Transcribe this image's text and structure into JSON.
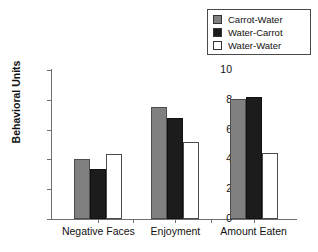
{
  "chart_data": {
    "type": "bar",
    "title": "",
    "xlabel": "",
    "ylabel": "Behavioral Units",
    "ylim": [
      0,
      10
    ],
    "yticks": [
      "0",
      "2",
      "4",
      "6",
      "8",
      "10"
    ],
    "grid": false,
    "legend_position": "top-right",
    "categories": [
      "Negative Faces",
      "Enjoyment",
      "Amount Eaten"
    ],
    "series": [
      {
        "name": "Carrot-Water",
        "color": "#808080",
        "values": [
          4.0,
          7.5,
          8.05
        ]
      },
      {
        "name": "Water-Carrot",
        "color": "#1c1c1c",
        "values": [
          3.35,
          6.75,
          8.2
        ]
      },
      {
        "name": "Water-Water",
        "color": "#ffffff",
        "values": [
          4.35,
          5.2,
          4.4
        ]
      }
    ]
  },
  "legend": {
    "items": [
      {
        "label": "Carrot-Water"
      },
      {
        "label": "Water-Carrot"
      },
      {
        "label": "Water-Water"
      }
    ]
  }
}
